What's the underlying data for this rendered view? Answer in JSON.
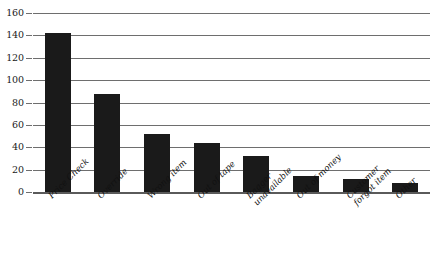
{
  "chart_data": {
    "type": "bar",
    "title": "",
    "subtitle": "",
    "xlabel": "",
    "ylabel": "",
    "ylim": [
      0,
      160
    ],
    "ytick_step": 20,
    "grid": true,
    "legend": false,
    "bar_color": "#1a1a1a",
    "gridline_color": "#6e6e6e",
    "categories": [
      "Price Check",
      "Override",
      "Wrong item",
      "Out of tape",
      "Bagger unavailable",
      "Out of money",
      "Customer forgot item",
      "Other"
    ],
    "category_lines": [
      [
        "Price Check"
      ],
      [
        "Override"
      ],
      [
        "Wrong item"
      ],
      [
        "Out of tape"
      ],
      [
        "Bagger",
        "unavailable"
      ],
      [
        "Out of money"
      ],
      [
        "Customer",
        "forgot item"
      ],
      [
        "Other"
      ]
    ],
    "values": [
      142,
      88,
      52,
      44,
      32,
      14,
      12,
      8
    ],
    "ytick_labels": [
      "0",
      "20",
      "40",
      "60",
      "80",
      "100",
      "120",
      "140",
      "160"
    ],
    "ytick_values": [
      0,
      20,
      40,
      60,
      80,
      100,
      120,
      140,
      160
    ]
  }
}
